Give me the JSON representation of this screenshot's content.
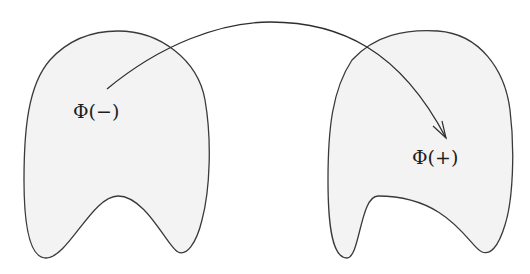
{
  "diagram": {
    "nodes": [
      {
        "id": "left-region",
        "label": "Φ(−)"
      },
      {
        "id": "right-region",
        "label": "Φ(+)"
      }
    ],
    "edges": [
      {
        "from": "left-region",
        "to": "right-region",
        "style": "curved-arrow"
      }
    ],
    "colors": {
      "region_fill": "#f3f3f3",
      "stroke": "#3a3a3a",
      "background": "#ffffff"
    }
  }
}
